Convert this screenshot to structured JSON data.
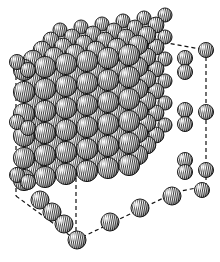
{
  "figure": {
    "title": "",
    "colors": {
      "background": "#ffffff",
      "ink": "#111111",
      "sphere_dark": "#3a3a3a",
      "sphere_light": "#f4f4f4"
    },
    "cell": {
      "front_bottom": [
        76,
        240
      ],
      "front_right_bottom": [
        176,
        192
      ],
      "back_right_bottom": [
        206,
        186
      ],
      "left_bottom": [
        16,
        196
      ],
      "top_left": [
        16,
        62
      ],
      "top_right": [
        206,
        50
      ],
      "edge_style": "dashed"
    }
  }
}
